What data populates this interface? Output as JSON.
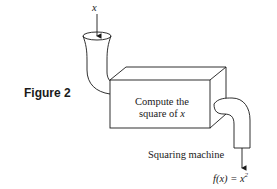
{
  "figure": {
    "label": "Figure 2",
    "input_label": "x",
    "box_line1": "Compute the",
    "box_line2_prefix": "square of ",
    "box_line2_var": "x",
    "caption": "Squaring machine",
    "output_label_f": "f(x) = x",
    "output_label_exp": "2"
  },
  "colors": {
    "ink": "#1a1a1a",
    "background": "#ffffff"
  }
}
